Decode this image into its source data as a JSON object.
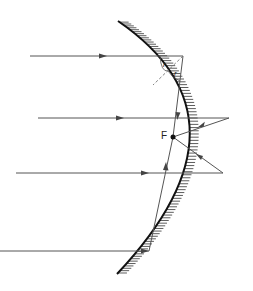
{
  "diagram": {
    "type": "concave-parabolic-mirror-ray-diagram",
    "colors": {
      "ray": "#555555",
      "mirror": "#111111",
      "hatch": "#333333",
      "normal": "#777777",
      "focus": "#111111",
      "background": "#ffffff"
    },
    "labels": {
      "focus": "F",
      "incidence_angle": "i",
      "reflection_angle": "r"
    },
    "focus_point": {
      "x": 173,
      "y": 137
    },
    "incident_rays": [
      {
        "y": 56,
        "x_start": 30,
        "x_end": 183,
        "arrow_x": 103
      },
      {
        "y": 118,
        "x_start": 38,
        "x_end": 229,
        "arrow_x": 120
      },
      {
        "y": 173,
        "x_start": 16,
        "x_end": 223,
        "arrow_x": 145
      },
      {
        "y": 251,
        "x_start": 0,
        "x_end": 149,
        "arrow_x": 145
      }
    ],
    "reflected_rays": [
      {
        "from": [
          183,
          56
        ],
        "to": [
          173,
          137
        ]
      },
      {
        "from": [
          229,
          118
        ],
        "to": [
          173,
          137
        ]
      },
      {
        "from": [
          223,
          173
        ],
        "to": [
          173,
          137
        ]
      },
      {
        "from": [
          149,
          251
        ],
        "to": [
          173,
          137
        ]
      }
    ]
  }
}
